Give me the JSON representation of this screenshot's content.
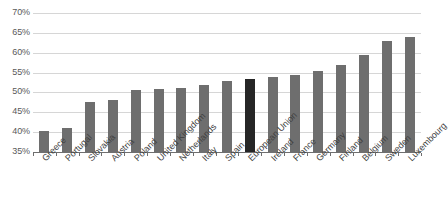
{
  "chart_data": {
    "type": "bar",
    "title": "",
    "subtitle": "",
    "xlabel": "",
    "ylabel": "",
    "ylim": [
      35,
      70
    ],
    "ytick_step": 5,
    "ytick_labels": [
      "70%",
      "65%",
      "60%",
      "55%",
      "50%",
      "45%",
      "40%",
      "35%"
    ],
    "ytick_values": [
      70,
      65,
      60,
      55,
      50,
      45,
      40,
      35
    ],
    "grid": true,
    "legend": "none",
    "value_suffix": "%",
    "categories": [
      "Greece",
      "Portugal",
      "Slovakia",
      "Austria",
      "Poland",
      "United Kingdom",
      "Netherlands",
      "Italy",
      "Spain",
      "European Union",
      "Ireland",
      "France",
      "Germany",
      "Finland",
      "Belgium",
      "Sweden",
      "Luxembourg"
    ],
    "values": [
      40.3,
      41.0,
      47.5,
      48.0,
      50.5,
      50.8,
      51.0,
      52.0,
      53.0,
      53.5,
      54.0,
      54.5,
      55.5,
      57.0,
      59.5,
      63.0,
      64.0
    ],
    "highlight_category": "European Union",
    "colors": {
      "bar": "#6e6e6e",
      "bar_highlight": "#262626",
      "gridline": "#d6d6d6",
      "axis": "#6f6f6f",
      "text": "#3f3f3f",
      "background": "#ffffff"
    }
  }
}
